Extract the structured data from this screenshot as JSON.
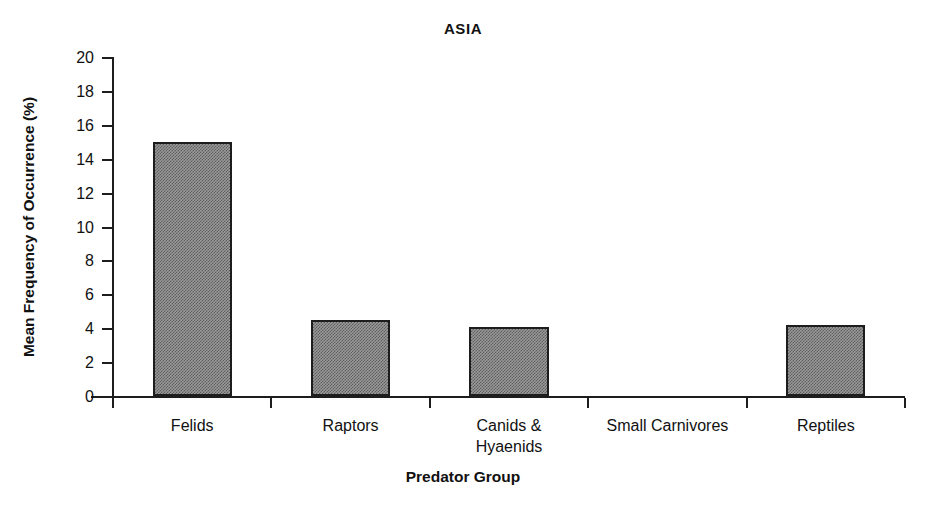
{
  "chart_data": {
    "type": "bar",
    "title": "ASIA",
    "xlabel": "Predator Group",
    "ylabel": "Mean Frequency of Occurrence (%)",
    "categories": [
      "Felids",
      "Raptors",
      "Canids & Hyaenids",
      "Small Carnivores",
      "Reptiles"
    ],
    "category_lines": [
      [
        "Felids"
      ],
      [
        "Raptors"
      ],
      [
        "Canids &",
        "Hyaenids"
      ],
      [
        "Small Carnivores"
      ],
      [
        "Reptiles"
      ]
    ],
    "values": [
      15.0,
      4.5,
      4.1,
      0,
      4.2
    ],
    "ylim": [
      0,
      20
    ],
    "ytick_labels": [
      "20",
      "18",
      "16",
      "14",
      "12",
      "10",
      "8",
      "6",
      "4",
      "2",
      "0"
    ],
    "ytick_values": [
      20,
      18,
      16,
      14,
      12,
      10,
      8,
      6,
      4,
      2,
      0
    ],
    "ytick_step": 2,
    "grid": false,
    "legend": false,
    "bar_fill_color": "#9a9a9a",
    "bar_edge_color": "#1d1d1d",
    "axis_color": "#1d1d1d",
    "background_color": "#ffffff"
  }
}
